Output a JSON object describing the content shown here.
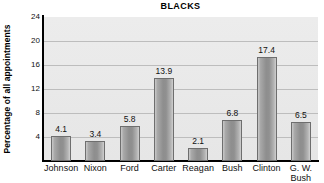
{
  "chart_data": {
    "type": "bar",
    "title": "BLACKS",
    "xlabel": "",
    "ylabel": "Percentage of all appointments",
    "categories": [
      "Johnson",
      "Nixon",
      "Ford",
      "Carter",
      "Reagan",
      "Bush",
      "Clinton",
      "G. W.\nBush"
    ],
    "values": [
      4.1,
      3.4,
      5.8,
      13.9,
      2.1,
      6.8,
      17.4,
      6.5
    ],
    "value_labels": [
      "4.1",
      "3.4",
      "5.8",
      "13.9",
      "2.1",
      "6.8",
      "17.4",
      "6.5"
    ],
    "ylim": [
      0,
      24
    ],
    "yticks": [
      4,
      8,
      12,
      16,
      20,
      24
    ],
    "ytick_labels": [
      "4",
      "8",
      "12",
      "16",
      "20",
      "24"
    ],
    "grid": true,
    "legend": "none",
    "series_color": "#9a9a9a",
    "plot_background": "#e9e9e9",
    "gridline_color": "#bdbdbd",
    "axis_color": "#000000"
  }
}
